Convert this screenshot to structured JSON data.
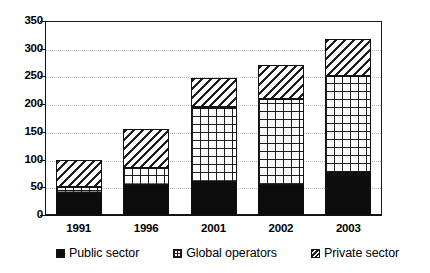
{
  "chart_data": {
    "type": "bar",
    "subtype": "stacked",
    "title": "",
    "xlabel": "",
    "ylabel": "",
    "ylim": [
      0,
      350
    ],
    "ytick_step": 50,
    "yticks": [
      "0",
      "50",
      "100",
      "150",
      "200",
      "250",
      "300",
      "350"
    ],
    "grid": true,
    "legend_position": "bottom",
    "categories": [
      "1991",
      "1996",
      "2001",
      "2002",
      "2003"
    ],
    "series": [
      {
        "name": "Public sector",
        "pattern": "solid-black",
        "values": [
          40,
          55,
          60,
          55,
          75
        ]
      },
      {
        "name": "Global operators",
        "pattern": "grid-hatch",
        "values": [
          10,
          30,
          135,
          155,
          175
        ]
      },
      {
        "name": "Private sector",
        "pattern": "diagonal-hatch",
        "values": [
          50,
          70,
          53,
          60,
          68
        ]
      }
    ],
    "totals": [
      100,
      155,
      248,
      270,
      318
    ]
  },
  "legend": {
    "items": [
      {
        "label": "Public sector",
        "swatch": "solid-black-swatch"
      },
      {
        "label": "Global operators",
        "swatch": "grid-hatch-swatch"
      },
      {
        "label": "Private sector",
        "swatch": "diagonal-hatch-swatch"
      }
    ]
  }
}
